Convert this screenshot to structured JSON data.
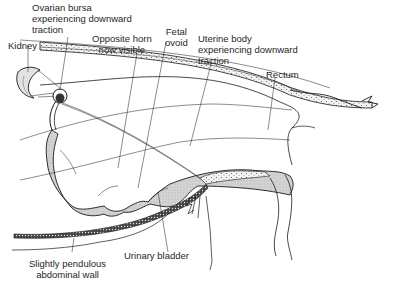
{
  "diagram": {
    "type": "anatomical-illustration",
    "labels": [
      {
        "id": "ovarian-bursa",
        "text": "Ovarian bursa\nexperiencing downward\ntraction"
      },
      {
        "id": "kidney",
        "text": "Kidney"
      },
      {
        "id": "opposite-horn",
        "text": "Opposite horn\nnow visible"
      },
      {
        "id": "fetal-ovoid",
        "text": "Fetal\novoid"
      },
      {
        "id": "uterine-body",
        "text": "Uterine body\nexperiencing downward\ntraction"
      },
      {
        "id": "rectum",
        "text": "Rectum"
      },
      {
        "id": "urinary-bladder",
        "text": "Urinary bladder"
      },
      {
        "id": "abdominal-wall",
        "text": "Slightly pendulous\nabdominal wall"
      }
    ],
    "colors": {
      "line": "#1a1a1a",
      "organ_fill": "#d6d6d6",
      "kidney_fill": "#e0e0e0",
      "background": "#ffffff"
    }
  }
}
